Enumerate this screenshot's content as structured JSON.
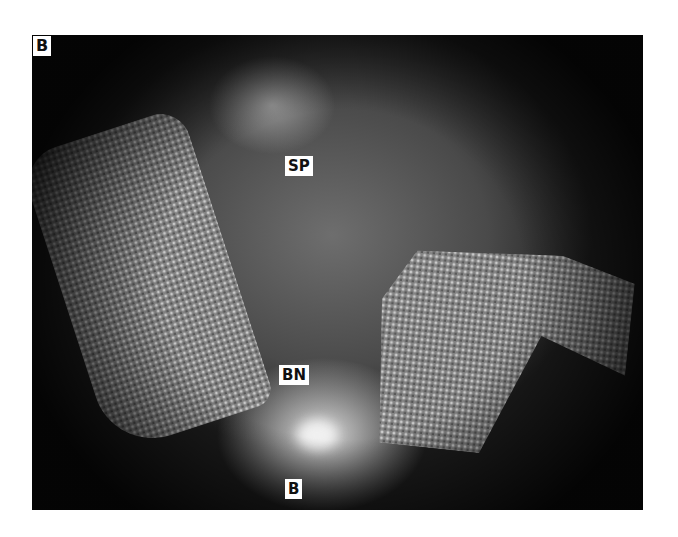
{
  "figure": {
    "panel_label": "B",
    "annotations": [
      {
        "id": "sp",
        "text": "SP"
      },
      {
        "id": "bn",
        "text": "BN"
      },
      {
        "id": "b",
        "text": "B"
      }
    ]
  }
}
